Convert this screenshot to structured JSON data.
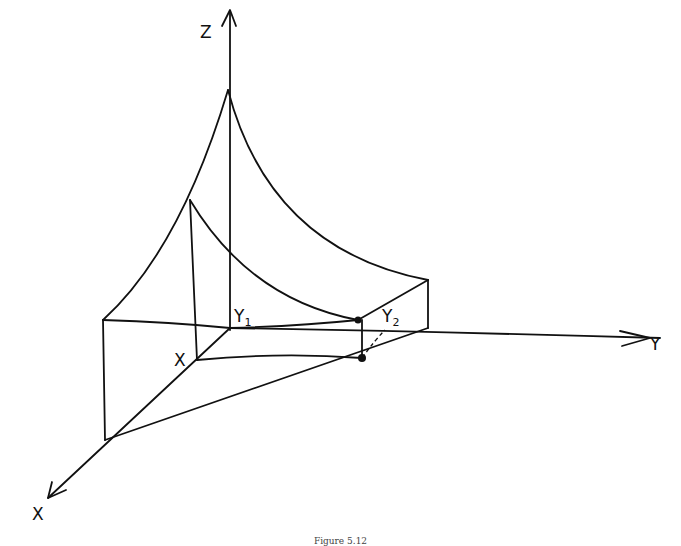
{
  "figure": {
    "caption": "Figure 5.12",
    "style": "hand-drawn pen sketch",
    "stroke_color": "#111111",
    "background": "#ffffff"
  },
  "axes": {
    "z": {
      "label": "Z"
    },
    "y": {
      "label": "Y"
    },
    "x": {
      "label": "X"
    }
  },
  "labels": {
    "y1": {
      "main": "Y",
      "sub": "1"
    },
    "y2": {
      "main": "Y",
      "sub": "2"
    },
    "x_point": "X"
  },
  "points": {
    "origin_y1": [
      230,
      328
    ],
    "x_point": [
      197,
      360
    ],
    "peak": [
      228,
      90
    ],
    "surface_point": [
      358,
      320
    ],
    "base_point": [
      362,
      358
    ]
  }
}
